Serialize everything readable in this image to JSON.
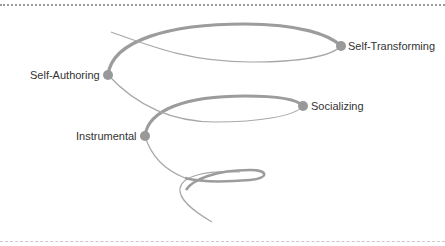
{
  "diagram": {
    "type": "spiral",
    "colors": {
      "thick_stroke": "#9c9c9c",
      "thin_stroke": "#a8a8a8",
      "node": "#999999",
      "label": "#333333",
      "top_border": "#9a9a9a",
      "bottom_border": "#c8c8c8"
    },
    "stages": [
      {
        "id": "self-transforming",
        "label": "Self-Transforming",
        "order": 4
      },
      {
        "id": "self-authoring",
        "label": "Self-Authoring",
        "order": 3
      },
      {
        "id": "socializing",
        "label": "Socializing",
        "order": 2
      },
      {
        "id": "instrumental",
        "label": "Instrumental",
        "order": 1
      }
    ]
  }
}
